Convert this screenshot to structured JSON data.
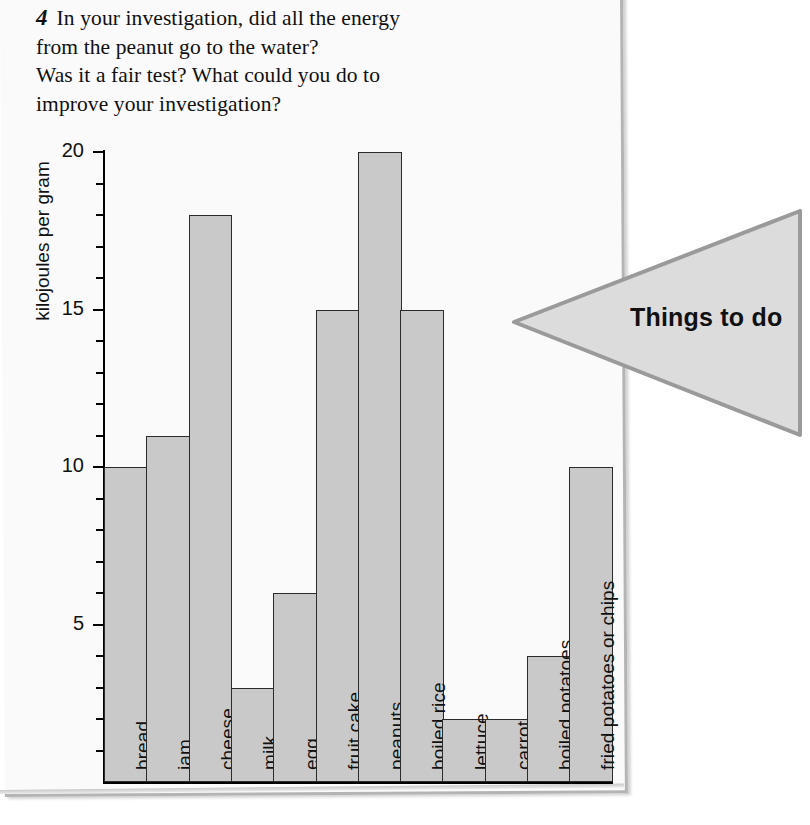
{
  "question": {
    "number": "4",
    "lines": [
      "In your investigation, did all the energy",
      "from the peanut go to the water?",
      "Was it a fair test?  What could you do to",
      "improve your investigation?"
    ],
    "full_text": "In your investigation, did all the energy from the peanut go to the water? Was it a fair test? What could you do to improve your investigation?"
  },
  "tab": {
    "label": "Things to do",
    "fill": "#dcdcdc",
    "stroke": "#9a9a9a"
  },
  "colors": {
    "page": "#fafafa",
    "bar_fill": "#c9c9c9",
    "bar_stroke": "#2b2b2b",
    "axis": "#000000",
    "text": "#111111"
  },
  "chart_data": {
    "type": "bar",
    "title": "",
    "xlabel": "",
    "ylabel": "kilojoules per gram",
    "ylim": [
      0,
      20
    ],
    "ytick_labels": [
      "5",
      "10",
      "15",
      "20"
    ],
    "ytick_values": [
      5,
      10,
      15,
      20
    ],
    "minor_tick_step": 1,
    "grid": false,
    "legend": false,
    "categories": [
      "bread",
      "jam",
      "cheese",
      "milk",
      "egg",
      "fruit cake",
      "peanuts",
      "boiled rice",
      "lettuce",
      "carrot",
      "boiled potatoes",
      "fried potatoes or chips"
    ],
    "values": [
      10,
      11,
      18,
      3,
      6,
      15,
      20,
      15,
      2,
      2,
      4,
      10
    ]
  }
}
